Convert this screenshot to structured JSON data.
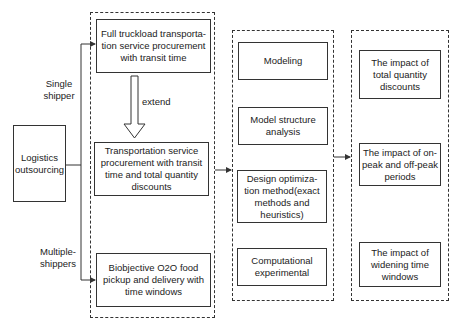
{
  "left": {
    "source": "Logistics outsourcing",
    "branch_top": "Single shipper",
    "branch_bottom": "Multiple-shippers"
  },
  "column1": {
    "items": [
      "Full truckload transporta-tion service procurement with transit time",
      "Transportation service procurement with transit time and total quantity discounts",
      "Biobjective O2O food pickup and delivery with time windows"
    ],
    "arrow_label": "extend"
  },
  "column2": {
    "items": [
      "Modeling",
      "Model structure analysis",
      "Design optimiza-tion method(exact methods and heuristics)",
      "Computational experimental"
    ]
  },
  "column3": {
    "items": [
      "The impact of total quantity discounts",
      "The impact of on-peak and off-peak periods",
      "The impact of widening time windows"
    ]
  },
  "colors": {
    "stroke": "#333333",
    "background": "#ffffff"
  }
}
